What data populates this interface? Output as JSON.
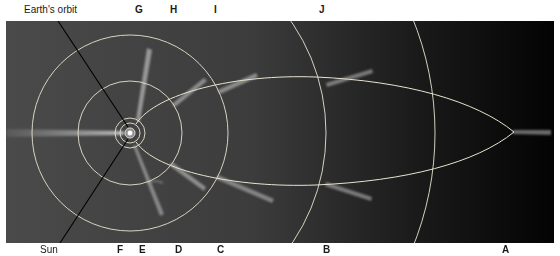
{
  "diagram": {
    "labels": {
      "earth_orbit": "Earth's orbit",
      "sun": "Sun"
    },
    "top_letters": [
      {
        "id": "G",
        "x": 138
      },
      {
        "id": "H",
        "x": 173
      },
      {
        "id": "I",
        "x": 215
      },
      {
        "id": "J",
        "x": 320
      }
    ],
    "bottom_letters": [
      {
        "id": "F",
        "x": 119
      },
      {
        "id": "E",
        "x": 141
      },
      {
        "id": "D",
        "x": 178
      },
      {
        "id": "C",
        "x": 220
      },
      {
        "id": "B",
        "x": 326
      },
      {
        "id": "A",
        "x": 505
      }
    ],
    "colors": {
      "background_left": "#4a4a4a",
      "background_right": "#050505",
      "orbit_lines": "#e8e4d0",
      "tail": "#d8d8d8",
      "earth_orbit_line": "#000000"
    }
  }
}
